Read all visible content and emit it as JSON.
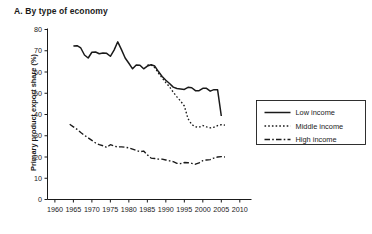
{
  "chart_data": {
    "type": "line",
    "title": "A. By type of economy",
    "xlabel": "",
    "ylabel": "Primary product export share (%)",
    "xlim": [
      1958,
      2011
    ],
    "ylim": [
      0,
      80
    ],
    "xticks": [
      1960,
      1965,
      1970,
      1975,
      1980,
      1985,
      1990,
      1995,
      2000,
      2005,
      2010
    ],
    "yticks": [
      0,
      10,
      20,
      30,
      40,
      50,
      60,
      70,
      80
    ],
    "grid": false,
    "legend_position": "right",
    "series": [
      {
        "name": "Low income",
        "style": "solid",
        "color": "#1a1a1a",
        "points": [
          [
            1965,
            72.2
          ],
          [
            1966,
            72.4
          ],
          [
            1967,
            71.3
          ],
          [
            1968,
            68.0
          ],
          [
            1969,
            66.6
          ],
          [
            1970,
            69.3
          ],
          [
            1971,
            69.4
          ],
          [
            1972,
            68.6
          ],
          [
            1973,
            68.9
          ],
          [
            1974,
            68.8
          ],
          [
            1975,
            67.4
          ],
          [
            1976,
            70.3
          ],
          [
            1977,
            74.2
          ],
          [
            1978,
            70.5
          ],
          [
            1979,
            66.6
          ],
          [
            1980,
            64.1
          ],
          [
            1981,
            61.5
          ],
          [
            1982,
            63.3
          ],
          [
            1983,
            63.2
          ],
          [
            1984,
            61.5
          ],
          [
            1985,
            62.8
          ],
          [
            1986,
            63.4
          ],
          [
            1987,
            62.8
          ],
          [
            1988,
            60.2
          ],
          [
            1989,
            57.9
          ],
          [
            1990,
            56.1
          ],
          [
            1991,
            54.6
          ],
          [
            1992,
            52.9
          ],
          [
            1993,
            52.2
          ],
          [
            1994,
            52.0
          ],
          [
            1995,
            51.8
          ],
          [
            1996,
            52.8
          ],
          [
            1997,
            52.6
          ],
          [
            1998,
            51.2
          ],
          [
            1999,
            51.2
          ],
          [
            2000,
            52.3
          ],
          [
            2001,
            52.3
          ],
          [
            2002,
            51.0
          ],
          [
            2003,
            51.7
          ],
          [
            2004,
            51.6
          ],
          [
            2005,
            39.3
          ]
        ]
      },
      {
        "name": "Middle income",
        "style": "dotted",
        "color": "#1a1a1a",
        "points": [
          [
            1985,
            63.2
          ],
          [
            1986,
            63.4
          ],
          [
            1987,
            62.0
          ],
          [
            1988,
            59.5
          ],
          [
            1989,
            57.2
          ],
          [
            1990,
            55.0
          ],
          [
            1991,
            53.0
          ],
          [
            1992,
            50.5
          ],
          [
            1993,
            48.3
          ],
          [
            1994,
            46.3
          ],
          [
            1995,
            44.0
          ],
          [
            1996,
            38.0
          ],
          [
            1997,
            35.3
          ],
          [
            1998,
            34.2
          ],
          [
            1999,
            34.0
          ],
          [
            2000,
            34.8
          ],
          [
            2001,
            34.2
          ],
          [
            2002,
            33.7
          ],
          [
            2003,
            34.0
          ],
          [
            2004,
            34.8
          ],
          [
            2005,
            35.2
          ],
          [
            2006,
            35.0
          ]
        ]
      },
      {
        "name": "High income",
        "style": "dashdot",
        "color": "#1a1a1a",
        "points": [
          [
            1964,
            35.4
          ],
          [
            1965,
            34.2
          ],
          [
            1966,
            33.0
          ],
          [
            1967,
            31.5
          ],
          [
            1968,
            30.2
          ],
          [
            1969,
            29.0
          ],
          [
            1970,
            27.8
          ],
          [
            1971,
            26.6
          ],
          [
            1972,
            25.8
          ],
          [
            1973,
            25.3
          ],
          [
            1974,
            24.5
          ],
          [
            1975,
            25.8
          ],
          [
            1976,
            25.2
          ],
          [
            1977,
            24.7
          ],
          [
            1978,
            24.8
          ],
          [
            1979,
            24.6
          ],
          [
            1980,
            24.3
          ],
          [
            1981,
            23.7
          ],
          [
            1982,
            23.1
          ],
          [
            1983,
            22.5
          ],
          [
            1984,
            22.8
          ],
          [
            1985,
            21.0
          ],
          [
            1986,
            19.5
          ],
          [
            1987,
            19.3
          ],
          [
            1988,
            19.0
          ],
          [
            1989,
            19.0
          ],
          [
            1990,
            18.6
          ],
          [
            1991,
            18.2
          ],
          [
            1992,
            17.8
          ],
          [
            1993,
            17.0
          ],
          [
            1994,
            16.9
          ],
          [
            1995,
            17.4
          ],
          [
            1996,
            17.3
          ],
          [
            1997,
            17.0
          ],
          [
            1998,
            16.6
          ],
          [
            1999,
            17.2
          ],
          [
            2000,
            18.3
          ],
          [
            2001,
            18.6
          ],
          [
            2002,
            18.8
          ],
          [
            2003,
            19.5
          ],
          [
            2004,
            20.0
          ],
          [
            2005,
            20.2
          ],
          [
            2006,
            20.0
          ]
        ]
      }
    ]
  },
  "legend": {
    "items": [
      {
        "label": "Low income",
        "style": "solid"
      },
      {
        "label": "Middle income",
        "style": "dotted"
      },
      {
        "label": "High income",
        "style": "dashdot"
      }
    ]
  }
}
